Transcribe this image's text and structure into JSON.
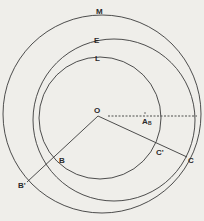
{
  "diagram": {
    "colors": {
      "background": "#efeeea",
      "stroke": "#3a3a3a"
    },
    "circles": [
      {
        "label": "M",
        "cx": 102,
        "cy": 114,
        "r": 99,
        "label_x": 96,
        "label_y": 14
      },
      {
        "label": "E",
        "cx": 114,
        "cy": 120,
        "r": 81,
        "label_x": 94,
        "label_y": 43
      },
      {
        "label": "L",
        "cx": 100,
        "cy": 118,
        "r": 61,
        "label_x": 95,
        "label_y": 61
      }
    ],
    "points": {
      "O": {
        "label": "O",
        "x": 98,
        "y": 116,
        "label_x": 94,
        "label_y": 113
      },
      "B": {
        "label": "B",
        "x": 55,
        "y": 158,
        "label_x": 59,
        "label_y": 163
      },
      "B_prime": {
        "label": "B'",
        "x": 27,
        "y": 182,
        "label_x": 18,
        "label_y": 188
      },
      "C_prime": {
        "label": "C'",
        "x": 158,
        "y": 148,
        "label_x": 156,
        "label_y": 155
      },
      "C": {
        "label": "C",
        "x": 187,
        "y": 157,
        "label_x": 188,
        "label_y": 163
      }
    },
    "angle_label": {
      "main": "A",
      "subscript": "B",
      "x": 142,
      "y": 124
    },
    "dashed_line": {
      "x1": 108,
      "y1": 116,
      "x2": 197,
      "y2": 116
    }
  }
}
